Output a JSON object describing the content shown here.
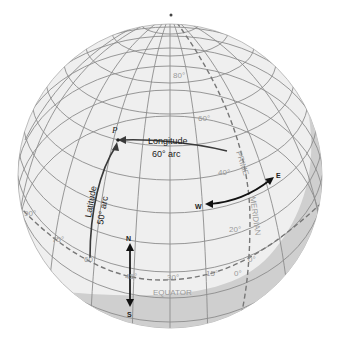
{
  "diagram": {
    "title": "",
    "colors": {
      "globe_fill": "#efefef",
      "shadow": "#cfcfcf",
      "grid_line": "#8c8c8c",
      "dashed_line": "#777777",
      "arrow": "#111111",
      "label_grey": "#9a9a9a"
    },
    "point": {
      "label": "P"
    },
    "longitude_arc": {
      "label": "Longitude",
      "value": "60° arc"
    },
    "latitude_arc": {
      "label": "Latitude",
      "value": "50° arc"
    },
    "directions": {
      "north": "N",
      "south": "S",
      "east": "E",
      "west": "W"
    },
    "equator_label": "EQUATOR",
    "prime_meridian_label": {
      "line1": "PRIME",
      "line2": "MERIDIAN"
    },
    "latitude_ticks": [
      "80°",
      "60°",
      "40°",
      "20°",
      "0°"
    ],
    "longitude_ticks": [
      "90°",
      "75°",
      "60°",
      "45°",
      "30°",
      "15°",
      "0°"
    ]
  }
}
